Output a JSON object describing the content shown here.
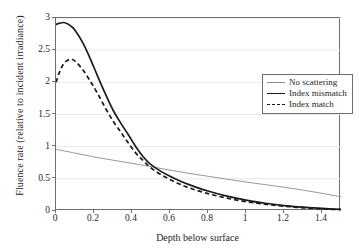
{
  "chart_data": {
    "type": "line",
    "title": "",
    "xlabel": "Depth below surface",
    "ylabel": "Fluence rate (relative to incident irradiance)",
    "xlim": [
      0,
      1.5
    ],
    "ylim": [
      0,
      3
    ],
    "xticks": [
      "0",
      "0.2",
      "0.4",
      "0.6",
      "0.8",
      "1",
      "1.2",
      "1.4"
    ],
    "xtick_values": [
      0,
      0.2,
      0.4,
      0.6,
      0.8,
      1.0,
      1.2,
      1.4
    ],
    "yticks": [
      "0",
      "0.5",
      "1",
      "1.5",
      "2",
      "2.5",
      "3"
    ],
    "ytick_values": [
      0,
      0.5,
      1,
      1.5,
      2,
      2.5,
      3
    ],
    "grid": "horizontal",
    "legend_position": "upper-right-inside",
    "series": [
      {
        "name": "No scattering",
        "style": "thin-solid",
        "color": "#8c8c8c",
        "x": [
          0,
          0.1,
          0.2,
          0.3,
          0.4,
          0.5,
          0.6,
          0.7,
          0.8,
          0.9,
          1.0,
          1.1,
          1.2,
          1.3,
          1.4,
          1.5
        ],
        "y": [
          0.96,
          0.9,
          0.84,
          0.79,
          0.74,
          0.69,
          0.635,
          0.585,
          0.54,
          0.495,
          0.45,
          0.41,
          0.37,
          0.325,
          0.275,
          0.22
        ]
      },
      {
        "name": "Index mismatch",
        "style": "thick-solid",
        "color": "#1a1a1a",
        "x": [
          0,
          0.02,
          0.04,
          0.06,
          0.08,
          0.1,
          0.14,
          0.18,
          0.22,
          0.26,
          0.3,
          0.34,
          0.38,
          0.42,
          0.46,
          0.5,
          0.55,
          0.6,
          0.65,
          0.7,
          0.8,
          0.9,
          1.0,
          1.1,
          1.2,
          1.3,
          1.4,
          1.5
        ],
        "y": [
          2.9,
          2.92,
          2.93,
          2.91,
          2.87,
          2.81,
          2.62,
          2.37,
          2.09,
          1.82,
          1.57,
          1.37,
          1.19,
          1.0,
          0.84,
          0.72,
          0.62,
          0.54,
          0.47,
          0.41,
          0.31,
          0.23,
          0.17,
          0.12,
          0.085,
          0.06,
          0.04,
          0.025
        ]
      },
      {
        "name": "Index match",
        "style": "dashed",
        "color": "#1a1a1a",
        "x": [
          0,
          0.02,
          0.04,
          0.06,
          0.08,
          0.1,
          0.14,
          0.18,
          0.22,
          0.26,
          0.3,
          0.34,
          0.38,
          0.42,
          0.46,
          0.5,
          0.55,
          0.6,
          0.65,
          0.7,
          0.8,
          0.9,
          1.0,
          1.1,
          1.2,
          1.3,
          1.4,
          1.5
        ],
        "y": [
          2.0,
          2.17,
          2.29,
          2.34,
          2.36,
          2.33,
          2.2,
          2.02,
          1.82,
          1.6,
          1.4,
          1.23,
          1.06,
          0.9,
          0.78,
          0.67,
          0.57,
          0.49,
          0.42,
          0.36,
          0.27,
          0.2,
          0.145,
          0.105,
          0.075,
          0.05,
          0.032,
          0.02
        ]
      }
    ]
  },
  "legend": {
    "items": [
      {
        "label": "No scattering"
      },
      {
        "label": "Index mismatch"
      },
      {
        "label": "Index match"
      }
    ]
  }
}
